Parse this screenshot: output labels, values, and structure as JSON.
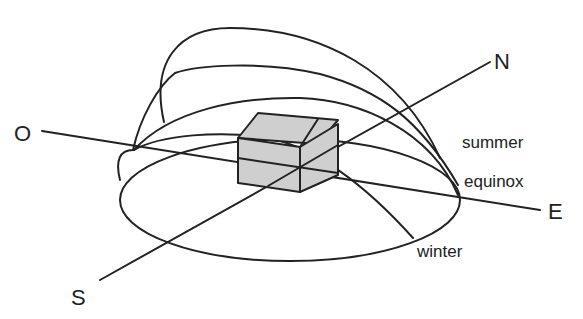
{
  "diagram": {
    "cardinal_points": {
      "west": "O",
      "north": "N",
      "east": "E",
      "south": "S"
    },
    "sun_paths": [
      {
        "id": "summer",
        "label": "summer"
      },
      {
        "id": "equinox",
        "label": "equinox"
      },
      {
        "id": "winter",
        "label": "winter"
      }
    ],
    "center_object": "house",
    "colors": {
      "stroke": "#222222",
      "house_fill": "#cfcfcf",
      "background": "#ffffff"
    }
  }
}
